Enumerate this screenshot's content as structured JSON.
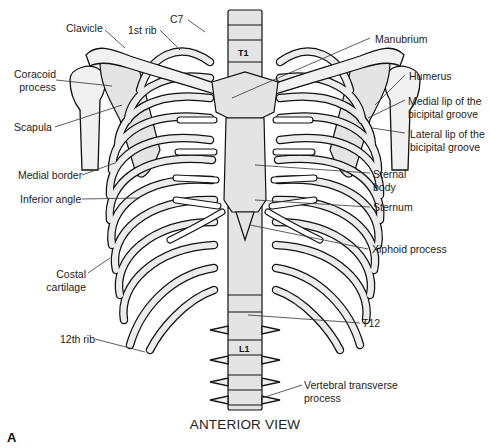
{
  "figure": {
    "caption": "ANTERIOR VIEW",
    "panel_letter": "A",
    "vertebra_marks": {
      "t1": "T1",
      "l1": "L1"
    },
    "labels": {
      "clavicle": "Clavicle",
      "first_rib": "1st rib",
      "c7": "C7",
      "coracoid_line1": "Coracoid",
      "coracoid_line2": "process",
      "scapula": "Scapula",
      "medial_border": "Medial border",
      "inferior_angle": "Inferior angle",
      "costal_line1": "Costal",
      "costal_line2": "cartilage",
      "twelfth_rib": "12th rib",
      "manubrium": "Manubrium",
      "humerus": "Humerus",
      "medial_lip_line1": "Medial lip of the",
      "medial_lip_line2": "bicipital groove",
      "lateral_lip_line1": "Lateral lip of the",
      "lateral_lip_line2": "bicipital groove",
      "sternal_body_line1": "Sternal",
      "sternal_body_line2": "body",
      "sternum": "Sternum",
      "xiphoid": "Xiphoid process",
      "t12": "T12",
      "vert_trans_line1": "Vertebral transverse",
      "vert_trans_line2": "process"
    }
  }
}
